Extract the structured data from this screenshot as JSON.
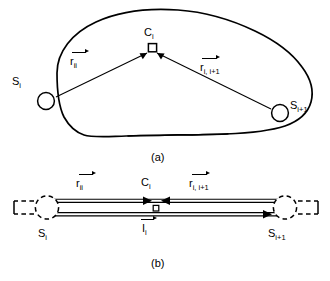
{
  "figure": {
    "panels": [
      {
        "id": "panel-a",
        "caption": "(a)",
        "description": "irregular closed contour with two source nodes and two vectors meeting at a center node",
        "nodes": [
          {
            "name": "source-left",
            "label_base": "S",
            "label_sub": "i",
            "shape": "open-circle"
          },
          {
            "name": "source-right",
            "label_base": "S",
            "label_sub": "i+1",
            "shape": "open-circle"
          },
          {
            "name": "center",
            "label_base": "C",
            "label_sub": "i",
            "shape": "open-square"
          }
        ],
        "vectors": [
          {
            "name": "vector-r-ii",
            "base": "r",
            "sub": "ii",
            "arrow": "right"
          },
          {
            "name": "vector-r-i-i1",
            "base": "r",
            "sub": "i, i+1",
            "arrow": "right"
          }
        ]
      },
      {
        "id": "panel-b",
        "caption": "(b)",
        "description": "equivalent transmission line representation with dashed terminal circles",
        "nodes": [
          {
            "name": "terminal-left",
            "label_base": "S",
            "label_sub": "i",
            "shape": "dashed-circle"
          },
          {
            "name": "terminal-right",
            "label_base": "S",
            "label_sub": "i+1",
            "shape": "dashed-circle"
          },
          {
            "name": "center",
            "label_base": "C",
            "label_sub": "i",
            "shape": "open-square"
          }
        ],
        "vectors": [
          {
            "name": "vector-r-ii",
            "base": "r",
            "sub": "ii",
            "arrow": "right"
          },
          {
            "name": "vector-r-i-i1",
            "base": "r",
            "sub": "i, i+1",
            "arrow": "right"
          },
          {
            "name": "current-i",
            "base": "I",
            "sub": "i",
            "arrow": "right"
          }
        ]
      }
    ],
    "colors": {
      "ink": "#000000",
      "background": "#ffffff"
    }
  }
}
